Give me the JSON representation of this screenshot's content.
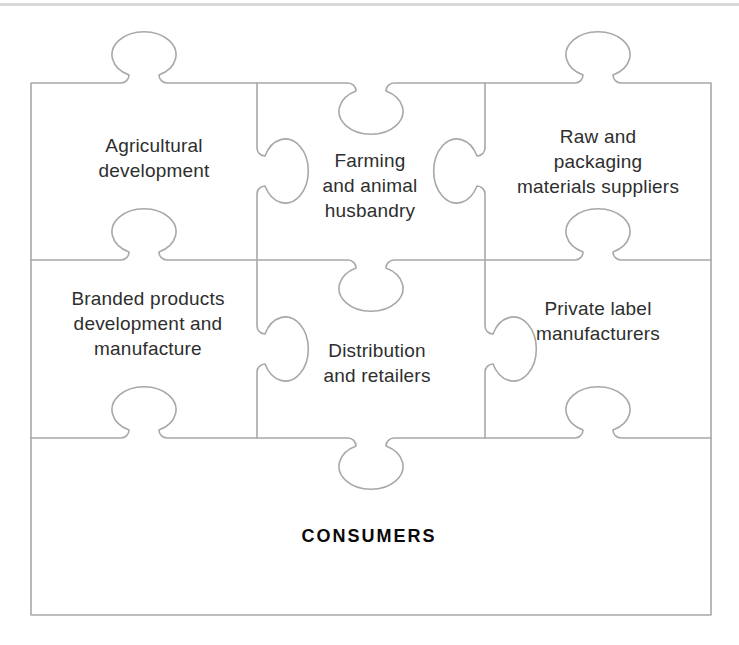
{
  "page": {
    "background_color": "#ffffff",
    "top_divider_color": "#d8d8d8"
  },
  "diagram": {
    "type": "jigsaw-puzzle",
    "outline_color": "#a8a8a8",
    "text_color": "#2e2e2e",
    "pieces": [
      {
        "id": "agricultural-development",
        "row": 1,
        "col": 1,
        "label": "Agricultural\ndevelopment"
      },
      {
        "id": "farming-and-animal-husbandry",
        "row": 1,
        "col": 2,
        "label": "Farming\nand animal\nhusbandry"
      },
      {
        "id": "raw-and-packaging-materials-suppliers",
        "row": 1,
        "col": 3,
        "label": "Raw and\npackaging\nmaterials suppliers"
      },
      {
        "id": "branded-products-development-and-manufacture",
        "row": 2,
        "col": 1,
        "label": "Branded products\ndevelopment and\nmanufacture"
      },
      {
        "id": "distribution-and-retailers",
        "row": 2,
        "col": 2,
        "label": "Distribution\nand retailers"
      },
      {
        "id": "private-label-manufacturers",
        "row": 2,
        "col": 3,
        "label": "Private label\nmanufacturers"
      },
      {
        "id": "consumers",
        "row": 3,
        "col": 1,
        "label": "CONSUMERS"
      }
    ]
  }
}
